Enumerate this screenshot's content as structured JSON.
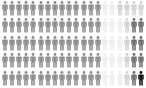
{
  "chart_data": {
    "type": "pictogram",
    "title": "",
    "rows": 5,
    "cols": 20,
    "total_icons": 100,
    "icon": "person-icon",
    "legend": [],
    "categories": [
      "medium gray",
      "light gray",
      "mid-light gray",
      "dark gray",
      "black"
    ],
    "values": [
      70,
      15,
      6,
      8,
      1
    ],
    "colors": {
      "medium": "#8c8c8c",
      "very_light": "#eeeeee",
      "light": "#d2d2d2",
      "dark": "#6e6e6e",
      "black": "#111111"
    },
    "grid": [
      [
        "medium",
        "medium",
        "medium",
        "medium",
        "medium",
        "medium",
        "medium",
        "medium",
        "medium",
        "medium",
        "medium",
        "medium",
        "medium",
        "medium",
        "very_light",
        "very_light",
        "light",
        "light",
        "light",
        "light"
      ],
      [
        "medium",
        "medium",
        "medium",
        "medium",
        "medium",
        "medium",
        "medium",
        "medium",
        "medium",
        "medium",
        "medium",
        "medium",
        "medium",
        "medium",
        "very_light",
        "very_light",
        "very_light",
        "light",
        "dark",
        "dark"
      ],
      [
        "medium",
        "medium",
        "medium",
        "medium",
        "medium",
        "medium",
        "medium",
        "medium",
        "medium",
        "medium",
        "medium",
        "medium",
        "medium",
        "medium",
        "very_light",
        "very_light",
        "very_light",
        "light",
        "dark",
        "dark"
      ],
      [
        "medium",
        "medium",
        "medium",
        "medium",
        "medium",
        "medium",
        "medium",
        "medium",
        "medium",
        "medium",
        "medium",
        "medium",
        "medium",
        "medium",
        "very_light",
        "very_light",
        "very_light",
        "light",
        "dark",
        "dark"
      ],
      [
        "medium",
        "medium",
        "medium",
        "medium",
        "medium",
        "medium",
        "medium",
        "medium",
        "medium",
        "medium",
        "medium",
        "medium",
        "medium",
        "medium",
        "very_light",
        "very_light",
        "very_light",
        "light",
        "dark",
        "black"
      ]
    ]
  }
}
